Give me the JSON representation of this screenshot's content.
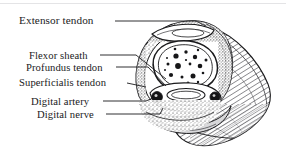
{
  "figure": {
    "kind": "anatomical-line-drawing",
    "background_color": "#ffffff",
    "ink_color": "#1a1a1c",
    "rule_color": "#e4e4e6"
  },
  "labels": [
    {
      "id": "extensor-tendon",
      "text": "Extensor tendon"
    },
    {
      "id": "flexor-sheath",
      "text": "Flexor sheath"
    },
    {
      "id": "profundus-tendon",
      "text": "Profundus tendon"
    },
    {
      "id": "superficialis-tendon",
      "text": "Superficialis tendon"
    },
    {
      "id": "digital-artery",
      "text": "Digital artery"
    },
    {
      "id": "digital-nerve",
      "text": "Digital nerve"
    }
  ]
}
